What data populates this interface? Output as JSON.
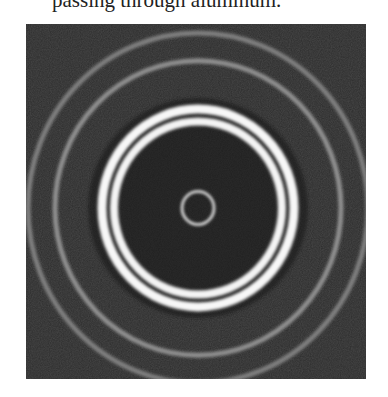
{
  "caption": {
    "text": "passing through aluminum."
  },
  "figure": {
    "background_color": "#2e2e2e",
    "center": {
      "x": 172,
      "y": 184
    },
    "rings": [
      {
        "name": "central-ring",
        "radius": 16,
        "width": 2.5,
        "color": "#f2f2f2",
        "opacity": 1.0
      },
      {
        "name": "bright-ring-inner",
        "radius": 84,
        "width": 8,
        "color": "#f4f4f4",
        "opacity": 1.0
      },
      {
        "name": "bright-ring-outer",
        "radius": 96,
        "width": 9,
        "color": "#f7f7f7",
        "opacity": 1.0
      },
      {
        "name": "faint-ring-1",
        "radius": 143,
        "width": 5,
        "color": "#9a9a9a",
        "opacity": 0.9
      },
      {
        "name": "faint-ring-2",
        "radius": 170,
        "width": 5,
        "color": "#8c8c8c",
        "opacity": 0.85
      }
    ]
  }
}
